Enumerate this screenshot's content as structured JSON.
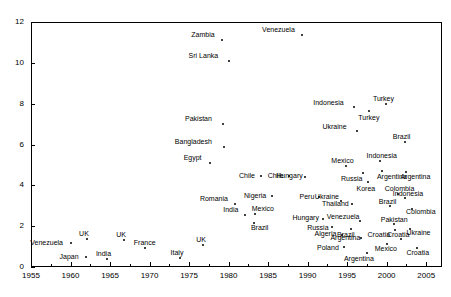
{
  "chart_data": {
    "type": "scatter",
    "title": "",
    "xlabel": "",
    "ylabel": "",
    "xlim": [
      1955,
      2007
    ],
    "ylim": [
      0,
      12
    ],
    "grid": false,
    "legend": "none",
    "xticks": [
      1955,
      1960,
      1965,
      1970,
      1975,
      1980,
      1985,
      1990,
      1995,
      2000,
      2005
    ],
    "yticks": [
      0,
      2,
      4,
      6,
      8,
      10,
      12
    ],
    "points": [
      {
        "label": "Venezuela",
        "x": 1989.3,
        "y": 11.35,
        "lx": -40,
        "ly": -9
      },
      {
        "label": "Zambia",
        "x": 1979.2,
        "y": 11.1,
        "lx": -31,
        "ly": -9
      },
      {
        "label": "Sri Lanka",
        "x": 1980.0,
        "y": 10.1,
        "lx": -40,
        "ly": -9
      },
      {
        "label": "Indonesia",
        "x": 1995.9,
        "y": 7.85,
        "lx": -41,
        "ly": -8
      },
      {
        "label": "Turkey",
        "x": 1999.9,
        "y": 8.0,
        "lx": -13,
        "ly": -9
      },
      {
        "label": "Turkey",
        "x": 1997.8,
        "y": 7.65,
        "lx": -11,
        "ly": 3
      },
      {
        "label": "Pakistan",
        "x": 1979.3,
        "y": 7.0,
        "lx": -38,
        "ly": -9
      },
      {
        "label": "Ukraine",
        "x": 1996.3,
        "y": 6.65,
        "lx": -35,
        "ly": -8
      },
      {
        "label": "Bangladesh",
        "x": 1979.4,
        "y": 5.9,
        "lx": -49,
        "ly": -9
      },
      {
        "label": "Brazil",
        "x": 2002.3,
        "y": 6.1,
        "lx": -12,
        "ly": -9
      },
      {
        "label": "Egypt",
        "x": 1977.6,
        "y": 5.1,
        "lx": -26,
        "ly": -9
      },
      {
        "label": "Indonesia",
        "x": 1999.1,
        "y": 5.2,
        "lx": -13,
        "ly": -9
      },
      {
        "label": "Mexico",
        "x": 1994.9,
        "y": 4.95,
        "lx": -15,
        "ly": -9
      },
      {
        "label": "Argentina",
        "x": 1999.4,
        "y": 4.7,
        "lx": -5,
        "ly": 2
      },
      {
        "label": "Russia",
        "x": 1997.0,
        "y": 4.6,
        "lx": -22,
        "ly": 2
      },
      {
        "label": "Argentina",
        "x": 2002.5,
        "y": 4.65,
        "lx": -6,
        "ly": 1
      },
      {
        "label": "Chile",
        "x": 1984.1,
        "y": 4.45,
        "lx": -22,
        "ly": -4
      },
      {
        "label": "Chile",
        "x": 1987.6,
        "y": 4.45,
        "lx": -21,
        "ly": -4
      },
      {
        "label": "Hungary",
        "x": 1989.7,
        "y": 4.4,
        "lx": -29,
        "ly": -5
      },
      {
        "label": "Korea",
        "x": 1997.7,
        "y": 4.15,
        "lx": -12,
        "ly": 3
      },
      {
        "label": "Nigeria",
        "x": 1985.5,
        "y": 3.5,
        "lx": -28,
        "ly": -4
      },
      {
        "label": "Peru",
        "x": 1991.5,
        "y": 3.45,
        "lx": -20,
        "ly": -4
      },
      {
        "label": "Colombia",
        "x": 2001.4,
        "y": 3.6,
        "lx": -13,
        "ly": -9
      },
      {
        "label": "Indonesia",
        "x": 2002.3,
        "y": 3.4,
        "lx": -12,
        "ly": -8
      },
      {
        "label": "Ukraine",
        "x": 1994.2,
        "y": 3.25,
        "lx": -26,
        "ly": -8
      },
      {
        "label": "Thailand",
        "x": 1995.6,
        "y": 3.1,
        "lx": -30,
        "ly": -4
      },
      {
        "label": "Brazil",
        "x": 2000.4,
        "y": 3.0,
        "lx": -11,
        "ly": -8
      },
      {
        "label": "Colombia",
        "x": 2003.2,
        "y": 2.85,
        "lx": -6,
        "ly": -1
      },
      {
        "label": "Romania",
        "x": 1980.8,
        "y": 3.1,
        "lx": -35,
        "ly": -9
      },
      {
        "label": "India",
        "x": 1982.1,
        "y": 2.55,
        "lx": -22,
        "ly": -9
      },
      {
        "label": "Mexico",
        "x": 1983.3,
        "y": 2.6,
        "lx": -3,
        "ly": -9
      },
      {
        "label": "Brazil",
        "x": 1983.2,
        "y": 2.15,
        "lx": -3,
        "ly": 1
      },
      {
        "label": "Hungary",
        "x": 1992.0,
        "y": 2.35,
        "lx": -31,
        "ly": -5
      },
      {
        "label": "Venezuela",
        "x": 1996.6,
        "y": 2.25,
        "lx": -33,
        "ly": -8
      },
      {
        "label": "Pakistan",
        "x": 2000.9,
        "y": 2.1,
        "lx": -13,
        "ly": -8
      },
      {
        "label": "Russia",
        "x": 1993.1,
        "y": 1.95,
        "lx": -25,
        "ly": -3
      },
      {
        "label": "Brazil",
        "x": 1995.5,
        "y": 1.85,
        "lx": -14,
        "ly": 2
      },
      {
        "label": "Croatia",
        "x": 2001.0,
        "y": 1.8,
        "lx": -27,
        "ly": 1
      },
      {
        "label": "Ukraine",
        "x": 2003.0,
        "y": 1.85,
        "lx": -4,
        "ly": 0
      },
      {
        "label": "Algeria",
        "x": 1994.3,
        "y": 1.55,
        "lx": -27,
        "ly": -5
      },
      {
        "label": "Argentina",
        "x": 1996.8,
        "y": 1.4,
        "lx": -31,
        "ly": -4
      },
      {
        "label": "Croatia",
        "x": 2001.8,
        "y": 1.35,
        "lx": -14,
        "ly": -8
      },
      {
        "label": "Mexico",
        "x": 2000.0,
        "y": 1.15,
        "lx": -12,
        "ly": 1
      },
      {
        "label": "Croatia",
        "x": 2003.9,
        "y": 0.95,
        "lx": -11,
        "ly": 1
      },
      {
        "label": "Poland",
        "x": 1994.6,
        "y": 1.0,
        "lx": -27,
        "ly": -3
      },
      {
        "label": "Argentina",
        "x": 1997.5,
        "y": 0.7,
        "lx": -23,
        "ly": 2
      },
      {
        "label": "Venezuela",
        "x": 1960.1,
        "y": 1.2,
        "lx": -41,
        "ly": -4
      },
      {
        "label": "UK",
        "x": 1962.1,
        "y": 1.35,
        "lx": -8,
        "ly": -9
      },
      {
        "label": "UK",
        "x": 1966.8,
        "y": 1.3,
        "lx": -8,
        "ly": -9
      },
      {
        "label": "France",
        "x": 1969.4,
        "y": 0.95,
        "lx": -11,
        "ly": -9
      },
      {
        "label": "Japan",
        "x": 1961.9,
        "y": 0.5,
        "lx": -26,
        "ly": -4
      },
      {
        "label": "India",
        "x": 1964.6,
        "y": 0.4,
        "lx": -11,
        "ly": -9
      },
      {
        "label": "Italy",
        "x": 1973.8,
        "y": 0.45,
        "lx": -9,
        "ly": -9
      },
      {
        "label": "UK",
        "x": 1976.8,
        "y": 1.1,
        "lx": -7,
        "ly": -9
      }
    ]
  },
  "axes": {
    "y_tick_labels": [
      "0",
      "2",
      "4",
      "6",
      "8",
      "10",
      "12"
    ],
    "x_tick_labels": [
      "1955",
      "1960",
      "1965",
      "1970",
      "1975",
      "1980",
      "1985",
      "1990",
      "1995",
      "2000",
      "2005"
    ]
  }
}
